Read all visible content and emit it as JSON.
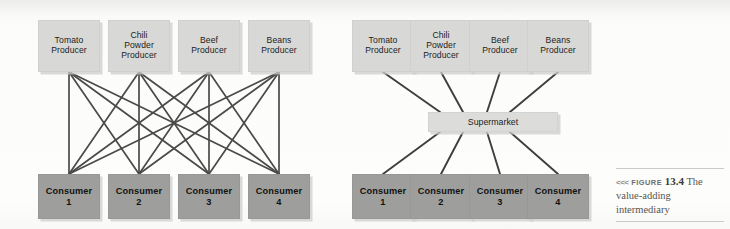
{
  "figure": {
    "arrows": "<<<",
    "label": "FIGURE",
    "number": "13.4",
    "title": "The value-adding intermediary"
  },
  "colors": {
    "page_background": "#fbfbfa",
    "producer_fill": "#d8d8d6",
    "consumer_fill": "#9e9e9c",
    "intermediary_fill": "#dcdcda",
    "link_stroke": "#4a4a48",
    "caption_rule": "#c9c9c6"
  },
  "diagrams": [
    {
      "id": "direct-distribution",
      "name": "Producers connect directly to every consumer",
      "producers": [
        {
          "label": "Tomato Producer",
          "lines": [
            "Tomato",
            "Producer"
          ]
        },
        {
          "label": "Chili Powder Producer",
          "lines": [
            "Chili",
            "Powder",
            "Producer"
          ]
        },
        {
          "label": "Beef Producer",
          "lines": [
            "Beef",
            "Producer"
          ]
        },
        {
          "label": "Beans Producer",
          "lines": [
            "Beans",
            "Producer"
          ]
        }
      ],
      "consumers": [
        {
          "label": "Consumer 1",
          "lines": [
            "Consumer",
            "1"
          ]
        },
        {
          "label": "Consumer 2",
          "lines": [
            "Consumer",
            "2"
          ]
        },
        {
          "label": "Consumer 3",
          "lines": [
            "Consumer",
            "3"
          ]
        },
        {
          "label": "Consumer 4",
          "lines": [
            "Consumer",
            "4"
          ]
        }
      ],
      "intermediary": null,
      "link_count": 16
    },
    {
      "id": "intermediary-distribution",
      "name": "Producers connect through a supermarket to consumers",
      "producers": [
        {
          "label": "Tomato Producer",
          "lines": [
            "Tomato",
            "Producer"
          ]
        },
        {
          "label": "Chili Powder Producer",
          "lines": [
            "Chili",
            "Powder",
            "Producer"
          ]
        },
        {
          "label": "Beef Producer",
          "lines": [
            "Beef",
            "Producer"
          ]
        },
        {
          "label": "Beans Producer",
          "lines": [
            "Beans",
            "Producer"
          ]
        }
      ],
      "consumers": [
        {
          "label": "Consumer 1",
          "lines": [
            "Consumer",
            "1"
          ]
        },
        {
          "label": "Consumer 2",
          "lines": [
            "Consumer",
            "2"
          ]
        },
        {
          "label": "Consumer 3",
          "lines": [
            "Consumer",
            "3"
          ]
        },
        {
          "label": "Consumer 4",
          "lines": [
            "Consumer",
            "4"
          ]
        }
      ],
      "intermediary": {
        "label": "Supermarket"
      },
      "link_count": 8
    }
  ],
  "labels": {
    "d0_p0_l0": "Tomato",
    "d0_p0_l1": "Producer",
    "d0_p1_l0": "Chili",
    "d0_p1_l1": "Powder",
    "d0_p1_l2": "Producer",
    "d0_p2_l0": "Beef",
    "d0_p2_l1": "Producer",
    "d0_p3_l0": "Beans",
    "d0_p3_l1": "Producer",
    "d0_c0_l0": "Consumer",
    "d0_c0_l1": "1",
    "d0_c1_l0": "Consumer",
    "d0_c1_l1": "2",
    "d0_c2_l0": "Consumer",
    "d0_c2_l1": "3",
    "d0_c3_l0": "Consumer",
    "d0_c3_l1": "4",
    "d1_p0_l0": "Tomato",
    "d1_p0_l1": "Producer",
    "d1_p1_l0": "Chili",
    "d1_p1_l1": "Powder",
    "d1_p1_l2": "Producer",
    "d1_p2_l0": "Beef",
    "d1_p2_l1": "Producer",
    "d1_p3_l0": "Beans",
    "d1_p3_l1": "Producer",
    "d1_c0_l0": "Consumer",
    "d1_c0_l1": "1",
    "d1_c1_l0": "Consumer",
    "d1_c1_l1": "2",
    "d1_c2_l0": "Consumer",
    "d1_c2_l1": "3",
    "d1_c3_l0": "Consumer",
    "d1_c3_l1": "4",
    "d1_mid": "Supermarket"
  }
}
